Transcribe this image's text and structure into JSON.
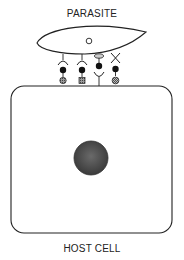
{
  "labels": {
    "parasite": "PARASITE",
    "host_cell": "HOST CELL"
  },
  "colors": {
    "stroke": "#222222",
    "ligand_fill": "#111111",
    "receptor_fill": "#777777",
    "nucleus_fill": "#555555"
  },
  "diagram": {
    "entities": [
      "parasite",
      "host cell"
    ],
    "parasite_features": [
      "nucleus (small open circle)"
    ],
    "host_features": [
      "nucleus (large shaded circle)"
    ],
    "interactions": [
      {
        "id": 1,
        "parasite_part": "cup receptor",
        "linker": "filled circle",
        "host_part": "shaded round receptor"
      },
      {
        "id": 2,
        "parasite_part": "cup receptor",
        "linker": "filled circle",
        "host_part": "shaded square receptor"
      },
      {
        "id": 3,
        "parasite_part": "oval ligand",
        "linker": "filled circle",
        "host_part": "cup receptor (Y shape)"
      },
      {
        "id": 4,
        "parasite_part": "X receptor",
        "linker": "filled circle",
        "host_part": "hatched round receptor"
      }
    ]
  }
}
